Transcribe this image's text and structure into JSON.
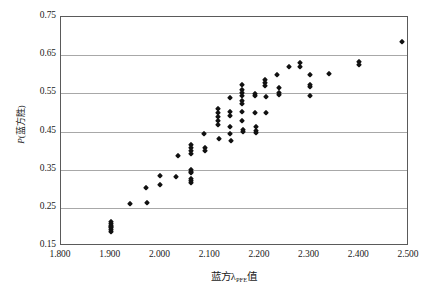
{
  "chart_data": {
    "type": "scatter",
    "title": "",
    "xlabel": "蓝方λPFE值",
    "xlabel_main_pre": "蓝方",
    "xlabel_symbol": "λ",
    "xlabel_subscript": "PFE",
    "xlabel_main_post": "值",
    "ylabel": "P(蓝方胜)",
    "ylabel_italic": "P",
    "ylabel_rest": "(蓝方胜)",
    "xlim": [
      1.8,
      2.5
    ],
    "ylim": [
      0.15,
      0.75
    ],
    "xticks": [
      "1.800",
      "1.900",
      "2.000",
      "2.100",
      "2.200",
      "2.300",
      "2.400",
      "2.500"
    ],
    "xtick_values": [
      1.8,
      1.9,
      2.0,
      2.1,
      2.2,
      2.3,
      2.4,
      2.5
    ],
    "yticks": [
      "0.15",
      "0.25",
      "0.35",
      "0.45",
      "0.55",
      "0.65",
      "0.75"
    ],
    "ytick_values": [
      0.15,
      0.25,
      0.35,
      0.45,
      0.55,
      0.65,
      0.75
    ],
    "grid": "horizontal",
    "legend": "none",
    "marker": "diamond",
    "marker_color": "#111111",
    "frame_color": "#5a5a5a",
    "gridline_color": "#a8a8a8",
    "background_color": "#ffffff",
    "points": [
      [
        1.9,
        0.203
      ],
      [
        1.9,
        0.198
      ],
      [
        1.9,
        0.208
      ],
      [
        1.9,
        0.193
      ],
      [
        1.9,
        0.212
      ],
      [
        1.9,
        0.188
      ],
      [
        1.9,
        0.2
      ],
      [
        1.938,
        0.259
      ],
      [
        1.97,
        0.302
      ],
      [
        1.972,
        0.263
      ],
      [
        2.0,
        0.333
      ],
      [
        2.0,
        0.309
      ],
      [
        2.032,
        0.332
      ],
      [
        2.035,
        0.385
      ],
      [
        2.062,
        0.349
      ],
      [
        2.062,
        0.345
      ],
      [
        2.062,
        0.34
      ],
      [
        2.062,
        0.32
      ],
      [
        2.062,
        0.315
      ],
      [
        2.062,
        0.325
      ],
      [
        2.062,
        0.415
      ],
      [
        2.062,
        0.408
      ],
      [
        2.062,
        0.398
      ],
      [
        2.062,
        0.39
      ],
      [
        2.088,
        0.443
      ],
      [
        2.09,
        0.408
      ],
      [
        2.09,
        0.4
      ],
      [
        2.115,
        0.508
      ],
      [
        2.115,
        0.498
      ],
      [
        2.115,
        0.488
      ],
      [
        2.115,
        0.478
      ],
      [
        2.115,
        0.468
      ],
      [
        2.118,
        0.43
      ],
      [
        2.14,
        0.538
      ],
      [
        2.14,
        0.5
      ],
      [
        2.14,
        0.49
      ],
      [
        2.14,
        0.463
      ],
      [
        2.14,
        0.444
      ],
      [
        2.142,
        0.425
      ],
      [
        2.165,
        0.572
      ],
      [
        2.165,
        0.558
      ],
      [
        2.165,
        0.55
      ],
      [
        2.165,
        0.542
      ],
      [
        2.165,
        0.53
      ],
      [
        2.165,
        0.522
      ],
      [
        2.165,
        0.5
      ],
      [
        2.165,
        0.478
      ],
      [
        2.167,
        0.455
      ],
      [
        2.167,
        0.448
      ],
      [
        2.19,
        0.548
      ],
      [
        2.19,
        0.543
      ],
      [
        2.19,
        0.498
      ],
      [
        2.192,
        0.462
      ],
      [
        2.192,
        0.452
      ],
      [
        2.192,
        0.446
      ],
      [
        2.21,
        0.578
      ],
      [
        2.21,
        0.57
      ],
      [
        2.21,
        0.585
      ],
      [
        2.212,
        0.54
      ],
      [
        2.212,
        0.498
      ],
      [
        2.235,
        0.598
      ],
      [
        2.238,
        0.565
      ],
      [
        2.238,
        0.552
      ],
      [
        2.238,
        0.546
      ],
      [
        2.258,
        0.618
      ],
      [
        2.28,
        0.63
      ],
      [
        2.28,
        0.62
      ],
      [
        2.3,
        0.598
      ],
      [
        2.3,
        0.572
      ],
      [
        2.3,
        0.566
      ],
      [
        2.3,
        0.543
      ],
      [
        2.34,
        0.6
      ],
      [
        2.4,
        0.632
      ],
      [
        2.4,
        0.625
      ],
      [
        2.485,
        0.685
      ]
    ]
  }
}
